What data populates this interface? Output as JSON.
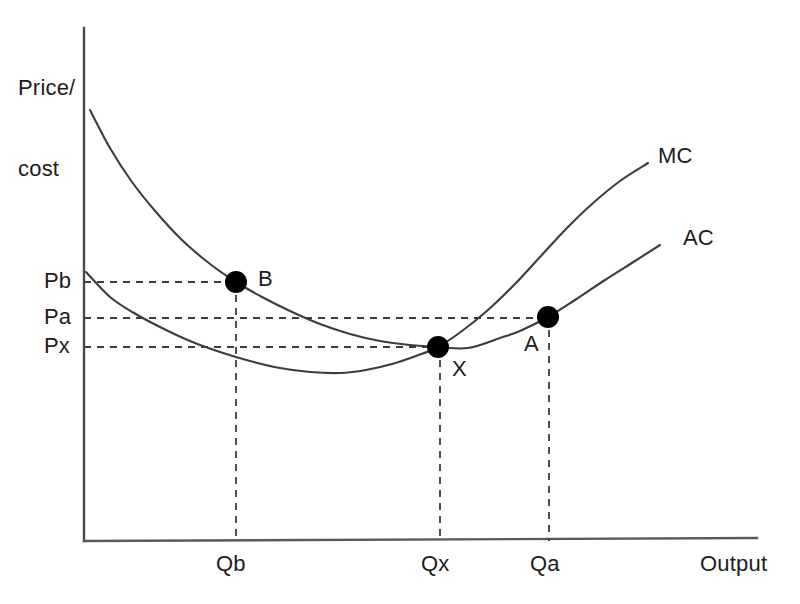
{
  "figure": {
    "background_color": "#ffffff",
    "ink_color": "#3d3d3d",
    "text_color": "#1c1c1c"
  },
  "axes": {
    "y_label_line1": "Price/",
    "y_label_line2": "cost",
    "x_label": "Output",
    "y_ticks": [
      {
        "label": "Pb",
        "y": 282
      },
      {
        "label": "Pa",
        "y": 318
      },
      {
        "label": "Px",
        "y": 347
      }
    ],
    "x_ticks": [
      {
        "label": "Qb",
        "x": 236
      },
      {
        "label": "Qx",
        "x": 440
      },
      {
        "label": "Qa",
        "x": 549
      }
    ]
  },
  "curves": [
    {
      "name": "MC",
      "label": "MC",
      "label_x": 658,
      "label_y": 143
    },
    {
      "name": "AC",
      "label": "AC",
      "label_x": 683,
      "label_y": 225
    }
  ],
  "points": [
    {
      "name": "B",
      "label": "B",
      "x": 236,
      "y": 282,
      "label_x": 258,
      "label_y": 266,
      "price": "Pb",
      "quantity": "Qb"
    },
    {
      "name": "X",
      "label": "X",
      "x": 438,
      "y": 347,
      "label_x": 452,
      "label_y": 356,
      "price": "Px",
      "quantity": "Qx"
    },
    {
      "name": "A",
      "label": "A",
      "x": 548,
      "y": 317,
      "label_x": 524,
      "label_y": 331,
      "price": "Pa",
      "quantity": "Qa"
    }
  ],
  "chart_data": {
    "type": "line",
    "title": "",
    "xlabel": "Output",
    "ylabel": "Price/cost",
    "grid": false,
    "legend": "inline-curve-labels",
    "xlim": [
      0,
      1
    ],
    "ylim": [
      0,
      1
    ],
    "xtick_labels": [
      "Qb",
      "Qx",
      "Qa"
    ],
    "ytick_labels": [
      "Pb",
      "Pa",
      "Px"
    ],
    "series": [
      {
        "name": "AC",
        "label": "AC",
        "description": "U-shaped average cost curve, minimum at point X",
        "points_px": [
          [
            90,
            110
          ],
          [
            110,
            148
          ],
          [
            132,
            182
          ],
          [
            156,
            212
          ],
          [
            182,
            240
          ],
          [
            210,
            264
          ],
          [
            236,
            282
          ],
          [
            262,
            297
          ],
          [
            290,
            311
          ],
          [
            320,
            324
          ],
          [
            350,
            334
          ],
          [
            380,
            341
          ],
          [
            410,
            345
          ],
          [
            438,
            347
          ],
          [
            468,
            348
          ],
          [
            500,
            338
          ],
          [
            520,
            331
          ],
          [
            548,
            317
          ],
          [
            575,
            300
          ],
          [
            605,
            280
          ],
          [
            635,
            261
          ],
          [
            660,
            245
          ]
        ]
      },
      {
        "name": "MC",
        "label": "MC",
        "description": "U-shaped marginal cost curve, cuts AC at its minimum (point X)",
        "points_px": [
          [
            86,
            272
          ],
          [
            110,
            297
          ],
          [
            134,
            313
          ],
          [
            160,
            327
          ],
          [
            190,
            341
          ],
          [
            220,
            352
          ],
          [
            250,
            361
          ],
          [
            280,
            368
          ],
          [
            310,
            372
          ],
          [
            340,
            373
          ],
          [
            366,
            370
          ],
          [
            392,
            364
          ],
          [
            416,
            356
          ],
          [
            438,
            347
          ],
          [
            462,
            331
          ],
          [
            488,
            310
          ],
          [
            514,
            285
          ],
          [
            540,
            257
          ],
          [
            566,
            229
          ],
          [
            592,
            204
          ],
          [
            620,
            181
          ],
          [
            648,
            163
          ]
        ]
      }
    ],
    "annotations": [
      {
        "label": "B",
        "x_label": "Qb",
        "y_label": "Pb",
        "curve": "AC"
      },
      {
        "label": "X",
        "x_label": "Qx",
        "y_label": "Px",
        "curve": "AC and MC intersection"
      },
      {
        "label": "A",
        "x_label": "Qa",
        "y_label": "Pa",
        "curve": "AC"
      }
    ]
  }
}
